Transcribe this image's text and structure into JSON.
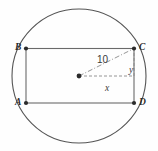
{
  "figure": {
    "background_color": "#fefefe",
    "stroke_color": "#4a4a4a",
    "label_color": "#2b2b2b",
    "circle": {
      "center_x": 79,
      "center_y": 76,
      "radius": 67
    },
    "rectangle": {
      "left": 26,
      "top": 48.5,
      "right": 134,
      "bottom": 103,
      "width": 108,
      "height": 54.5
    },
    "vertices": [
      {
        "name": "B",
        "label": "B",
        "x": 26,
        "y": 48.5,
        "position": "top-left"
      },
      {
        "name": "C",
        "label": "C",
        "x": 134,
        "y": 48.5,
        "position": "top-right"
      },
      {
        "name": "A",
        "label": "A",
        "x": 26,
        "y": 103,
        "position": "bottom-left"
      },
      {
        "name": "D",
        "label": "D",
        "x": 134,
        "y": 103,
        "position": "bottom-right"
      }
    ],
    "center_point": {
      "label": "",
      "x": 79,
      "y": 76
    },
    "measurements": [
      {
        "name": "radius",
        "label": "10",
        "style": "dash-dot",
        "from": "center",
        "to": "C"
      },
      {
        "name": "half-width",
        "label": "x",
        "style": "dashed",
        "from": "center",
        "to": "right-side"
      },
      {
        "name": "half-height",
        "label": "y",
        "style": "dashed",
        "from": "right-side",
        "to": "C"
      }
    ]
  }
}
